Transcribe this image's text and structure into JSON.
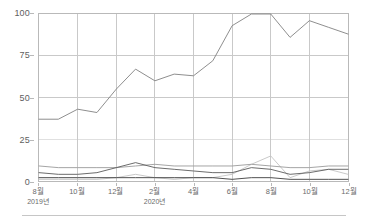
{
  "chart_data": {
    "type": "line",
    "title": "",
    "subtitle": "",
    "xlabel": "",
    "ylabel": "",
    "grid": true,
    "legend_position": "none",
    "ylim": [
      0,
      100
    ],
    "y_ticks": [
      0,
      25,
      50,
      75,
      100
    ],
    "y_tick_labels": [
      "0",
      "25",
      "50",
      "75",
      "100"
    ],
    "x": [
      "2019-08",
      "2019-09",
      "2019-10",
      "2019-11",
      "2019-12",
      "2020-01",
      "2020-02",
      "2020-03",
      "2020-04",
      "2020-05",
      "2020-06",
      "2020-07",
      "2020-08",
      "2020-09",
      "2020-10",
      "2020-11",
      "2020-12"
    ],
    "x_major_labels": [
      "8월",
      "10월",
      "12월",
      "2월",
      "4월",
      "6월",
      "8월",
      "10월",
      "12월"
    ],
    "x_major_positions": [
      0,
      2,
      4,
      6,
      8,
      10,
      12,
      14,
      16
    ],
    "x_year_labels": [
      {
        "index": 0,
        "label": "2019년"
      },
      {
        "index": 6,
        "label": "2020년"
      }
    ],
    "series": [
      {
        "name": "series-1",
        "color": "#808080",
        "values": [
          37,
          37,
          43,
          41,
          55,
          67,
          60,
          64,
          63,
          72,
          93,
          100,
          100,
          86,
          96,
          92,
          88
        ]
      },
      {
        "name": "series-2",
        "color": "#9a9a9a",
        "values": [
          9,
          8,
          8,
          8,
          8,
          9,
          10,
          9,
          9,
          9,
          9,
          10,
          9,
          8,
          8,
          9,
          9
        ]
      },
      {
        "name": "series-3",
        "color": "#5a5a5a",
        "values": [
          5,
          4,
          4,
          5,
          8,
          11,
          8,
          7,
          6,
          5,
          5,
          8,
          7,
          4,
          5,
          7,
          7
        ]
      },
      {
        "name": "series-4",
        "color": "#3c3c3c",
        "values": [
          2,
          2,
          2,
          2,
          2,
          2,
          2,
          2,
          2,
          2,
          1,
          2,
          2,
          1,
          1,
          1,
          1
        ]
      },
      {
        "name": "series-5",
        "color": "#c2c2c2",
        "values": [
          1,
          1,
          1,
          1,
          2,
          4,
          2,
          1,
          2,
          2,
          4,
          10,
          15,
          2,
          6,
          7,
          4
        ]
      }
    ]
  },
  "axis": {
    "y_label_0": "0",
    "y_label_25": "25",
    "y_label_50": "50",
    "y_label_75": "75",
    "y_label_100": "100"
  },
  "colors": {
    "frame": "#b9b9b9",
    "grid": "#c9c9c9",
    "grid_light": "#e0e0e0",
    "footer_rule": "#c6c6c6",
    "tick_text": "#6b6b6b"
  }
}
